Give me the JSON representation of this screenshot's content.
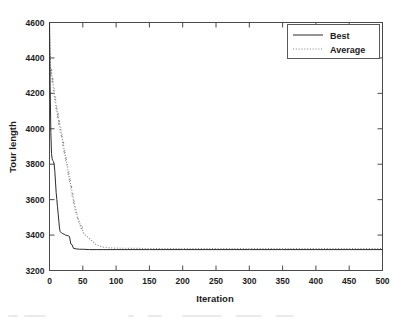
{
  "chart_data": {
    "type": "line",
    "title": "",
    "xlabel": "Iteration",
    "ylabel": "Tour length",
    "xlim": [
      0,
      500
    ],
    "ylim": [
      3200,
      4600
    ],
    "xticks": [
      0,
      50,
      100,
      150,
      200,
      250,
      300,
      350,
      400,
      450,
      500
    ],
    "yticks": [
      3200,
      3400,
      3600,
      3800,
      4000,
      4200,
      4400,
      4600
    ],
    "xticklabels": [
      "0",
      "50",
      "100",
      "150",
      "200",
      "250",
      "300",
      "350",
      "400",
      "450",
      "500"
    ],
    "yticklabels": [
      "3200",
      "3400",
      "3600",
      "3800",
      "4000",
      "4200",
      "4400",
      "4600"
    ],
    "grid": false,
    "legend_position": "upper right",
    "series": [
      {
        "name": "Best",
        "style": "solid",
        "color": "#2b2b2b",
        "x": [
          0,
          1,
          2,
          3,
          4,
          5,
          6,
          7,
          8,
          9,
          10,
          11,
          12,
          13,
          14,
          15,
          16,
          18,
          20,
          22,
          24,
          26,
          28,
          30,
          32,
          34,
          36,
          40,
          45,
          50,
          60,
          70,
          80,
          100,
          150,
          200,
          250,
          300,
          350,
          400,
          450,
          500
        ],
        "y": [
          4600,
          4240,
          3980,
          3860,
          3830,
          3820,
          3815,
          3800,
          3760,
          3700,
          3640,
          3600,
          3560,
          3520,
          3480,
          3440,
          3420,
          3412,
          3408,
          3405,
          3400,
          3398,
          3396,
          3392,
          3350,
          3345,
          3325,
          3322,
          3320,
          3320,
          3318,
          3318,
          3318,
          3318,
          3318,
          3318,
          3318,
          3318,
          3318,
          3318,
          3318,
          3318
        ]
      },
      {
        "name": "Average",
        "style": "dotted",
        "color": "#8d8d8d",
        "x": [
          0,
          1,
          2,
          3,
          4,
          5,
          6,
          7,
          8,
          9,
          10,
          11,
          12,
          13,
          14,
          15,
          16,
          17,
          18,
          19,
          20,
          21,
          22,
          23,
          24,
          25,
          26,
          27,
          28,
          29,
          30,
          31,
          32,
          33,
          34,
          35,
          36,
          37,
          38,
          39,
          40,
          41,
          42,
          43,
          44,
          45,
          46,
          47,
          48,
          49,
          50,
          52,
          54,
          56,
          58,
          60,
          62,
          64,
          66,
          68,
          70,
          75,
          80,
          90,
          100,
          150,
          200,
          250,
          300,
          350,
          400,
          450,
          500
        ],
        "y": [
          4600,
          4430,
          4300,
          4340,
          4260,
          4290,
          4200,
          4230,
          4150,
          4180,
          4100,
          4130,
          4060,
          4090,
          4020,
          4050,
          3980,
          4010,
          3950,
          3970,
          3900,
          3930,
          3860,
          3880,
          3820,
          3840,
          3790,
          3800,
          3740,
          3760,
          3700,
          3720,
          3660,
          3680,
          3620,
          3640,
          3580,
          3600,
          3545,
          3560,
          3520,
          3530,
          3490,
          3500,
          3470,
          3480,
          3450,
          3460,
          3430,
          3440,
          3420,
          3405,
          3400,
          3392,
          3388,
          3380,
          3372,
          3368,
          3360,
          3352,
          3345,
          3338,
          3332,
          3328,
          3326,
          3324,
          3324,
          3324,
          3324,
          3324,
          3324,
          3324,
          3324
        ]
      }
    ]
  },
  "legend": {
    "items": [
      {
        "label": "Best"
      },
      {
        "label": "Average"
      }
    ]
  }
}
